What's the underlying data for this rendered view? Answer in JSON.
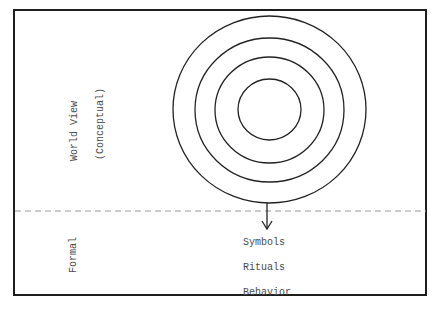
{
  "diagram": {
    "upper_region": {
      "label": "World View",
      "sublabel": "(Conceptual)"
    },
    "lower_region": {
      "label": "Formal",
      "items": [
        "Symbols",
        "Rituals",
        "Behavior"
      ]
    },
    "concentric_circles": {
      "count": 4,
      "center": [
        269,
        109
      ],
      "radii": [
        [
          97,
          94
        ],
        [
          75,
          72
        ],
        [
          55,
          53
        ],
        [
          32,
          31
        ]
      ]
    },
    "divider": {
      "style": "dashed",
      "y": 211
    },
    "arrow": {
      "direction": "down",
      "from": "outer-circle",
      "to": "formal-items"
    },
    "colors": {
      "stroke": "#222222",
      "text": "#4a4a4a",
      "dash": "#9a9a9a"
    }
  }
}
